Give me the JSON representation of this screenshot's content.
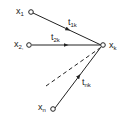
{
  "diagram": {
    "nodes": [
      {
        "id": "x1",
        "label": "x",
        "sub": "1"
      },
      {
        "id": "x2",
        "label": "x",
        "sub": "2,"
      },
      {
        "id": "xn",
        "label": "x",
        "sub": "n"
      },
      {
        "id": "xk",
        "label": "x",
        "sub": "k"
      }
    ],
    "edges": [
      {
        "from": "x1",
        "to": "xk",
        "label": "t",
        "sub": "1k",
        "style": "solid"
      },
      {
        "from": "x2",
        "to": "xk",
        "label": "t",
        "sub": "2k",
        "style": "solid"
      },
      {
        "from": "xn",
        "to": "xk",
        "label": "t",
        "sub": "nk",
        "style": "solid"
      },
      {
        "from": "ellipsis",
        "to": "xk",
        "label": "",
        "style": "dashed"
      }
    ]
  }
}
